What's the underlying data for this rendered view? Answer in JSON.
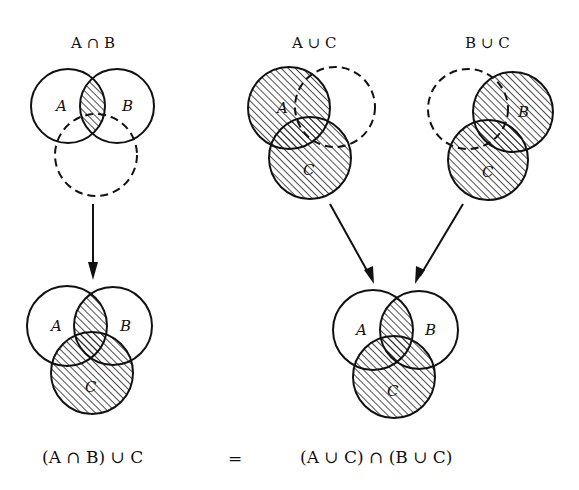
{
  "figure": {
    "panels": [
      {
        "id": "a-intersect-b",
        "title": "A ∩ B",
        "circles": [
          {
            "label": "A",
            "cx": 68,
            "cy": 106,
            "r": 37,
            "dashed": false
          },
          {
            "label": "B",
            "cx": 117,
            "cy": 106,
            "r": 37,
            "dashed": false
          },
          {
            "label": "",
            "cx": 96,
            "cy": 155,
            "r": 41,
            "dashed": true
          }
        ],
        "shaded": "A∩B"
      },
      {
        "id": "a-union-c",
        "title": "A ∪ C",
        "circles": [
          {
            "label": "A",
            "cx": 289,
            "cy": 108,
            "r": 41,
            "dashed": false
          },
          {
            "label": "",
            "cx": 335,
            "cy": 107,
            "r": 40,
            "dashed": true
          },
          {
            "label": "C",
            "cx": 310,
            "cy": 158,
            "r": 41,
            "dashed": false
          }
        ],
        "shaded": "A∪C"
      },
      {
        "id": "b-union-c",
        "title": "B ∪ C",
        "circles": [
          {
            "label": "",
            "cx": 468,
            "cy": 109,
            "r": 40,
            "dashed": true
          },
          {
            "label": "B",
            "cx": 513,
            "cy": 112,
            "r": 40,
            "dashed": false
          },
          {
            "label": "C",
            "cx": 488,
            "cy": 160,
            "r": 40,
            "dashed": false
          }
        ],
        "shaded": "B∪C"
      },
      {
        "id": "result-left",
        "title": "",
        "circles": [
          {
            "label": "A",
            "cx": 67,
            "cy": 326,
            "r": 40,
            "dashed": false
          },
          {
            "label": "B",
            "cx": 113,
            "cy": 326,
            "r": 39,
            "dashed": false
          },
          {
            "label": "C",
            "cx": 92,
            "cy": 373,
            "r": 41,
            "dashed": false
          }
        ],
        "shaded": "(A∩B)∪C"
      },
      {
        "id": "result-right",
        "title": "",
        "circles": [
          {
            "label": "A",
            "cx": 373,
            "cy": 330,
            "r": 40,
            "dashed": false
          },
          {
            "label": "B",
            "cx": 419,
            "cy": 330,
            "r": 39,
            "dashed": false
          },
          {
            "label": "C",
            "cx": 394,
            "cy": 377,
            "r": 41,
            "dashed": false
          }
        ],
        "shaded": "(A∪C)∩(B∪C)"
      }
    ],
    "arrows": [
      {
        "from": "a-intersect-b",
        "to": "result-left"
      },
      {
        "from": "a-union-c",
        "to": "result-right"
      },
      {
        "from": "b-union-c",
        "to": "result-right"
      }
    ],
    "equation": {
      "left": "(A ∩ B) ∪ C",
      "equals": "=",
      "right": "(A ∪ C) ∩ (B ∪ C)"
    },
    "colors": {
      "stroke": "#111111",
      "hatch": "#222222",
      "background": "#ffffff"
    }
  }
}
